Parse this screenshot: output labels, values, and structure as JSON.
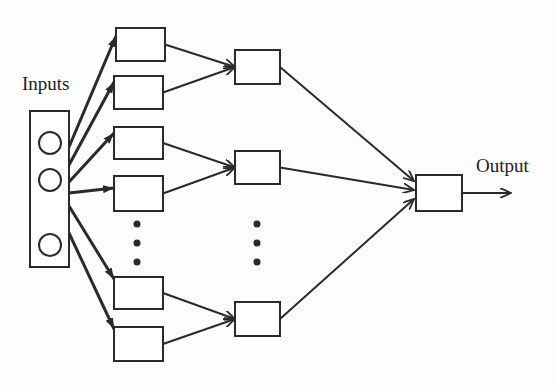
{
  "labels": {
    "inputs": "Inputs",
    "output": "Output"
  },
  "colors": {
    "stroke": "#2a2a2a",
    "background": "#fdfdfd"
  },
  "diagram": {
    "input_box": {
      "x": 30,
      "y": 111,
      "w": 39,
      "h": 156
    },
    "input_nodes": [
      {
        "cx": 50,
        "cy": 143,
        "r": 11
      },
      {
        "cx": 50,
        "cy": 180,
        "r": 11
      },
      {
        "cx": 50,
        "cy": 245,
        "r": 11
      }
    ],
    "layer1": [
      {
        "x": 116,
        "y": 28,
        "w": 49,
        "h": 33
      },
      {
        "x": 114,
        "y": 76,
        "w": 49,
        "h": 33
      },
      {
        "x": 114,
        "y": 127,
        "w": 49,
        "h": 32
      },
      {
        "x": 114,
        "y": 176,
        "w": 49,
        "h": 35
      },
      {
        "x": 114,
        "y": 277,
        "w": 49,
        "h": 32
      },
      {
        "x": 114,
        "y": 327,
        "w": 49,
        "h": 34
      }
    ],
    "layer2": [
      {
        "x": 235,
        "y": 50,
        "w": 45,
        "h": 34
      },
      {
        "x": 235,
        "y": 151,
        "w": 45,
        "h": 33
      },
      {
        "x": 235,
        "y": 302,
        "w": 45,
        "h": 34
      }
    ],
    "output_node": {
      "x": 416,
      "y": 175,
      "w": 46,
      "h": 36
    },
    "layer1_ellipsis": {
      "x": 137,
      "ys": [
        224,
        243,
        262
      ]
    },
    "layer2_ellipsis": {
      "x": 257,
      "ys": [
        224,
        243,
        262
      ]
    }
  }
}
